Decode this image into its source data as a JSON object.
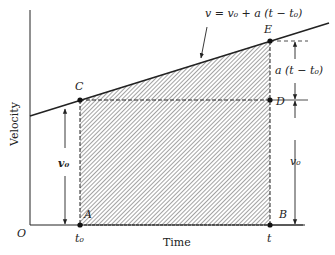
{
  "diagram": {
    "type": "velocity-time graph",
    "axes": {
      "x_label": "Time",
      "y_label": "Velocity",
      "origin_label": "O"
    },
    "line": {
      "equation_label": "v = v₀ + a (t − t₀)"
    },
    "points": {
      "A": "A",
      "B": "B",
      "C": "C",
      "D": "D",
      "E": "E"
    },
    "ticks": {
      "t0": "t₀",
      "t": "t"
    },
    "dimensions": {
      "left_v0": "v₀",
      "right_v0": "v₀",
      "increase": "a (t − t₀)"
    },
    "colors": {
      "ink": "#222222",
      "hatch": "#555555"
    }
  }
}
